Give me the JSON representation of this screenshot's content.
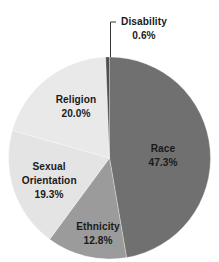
{
  "chart_data": {
    "type": "pie",
    "title": "",
    "start_angle_deg": 0,
    "direction": "clockwise",
    "slices": [
      {
        "label": "Race",
        "value": 47.3,
        "display": "47.3%",
        "color": "#707070"
      },
      {
        "label": "Ethnicity",
        "value": 12.8,
        "display": "12.8%",
        "color": "#9b9b9b"
      },
      {
        "label": "Sexual Orientation",
        "value": 19.3,
        "display": "19.3%",
        "color": "#e4e4e4"
      },
      {
        "label": "Religion",
        "value": 20.0,
        "display": "20.0%",
        "color": "#e9e9e9"
      },
      {
        "label": "Disability",
        "value": 0.6,
        "display": "0.6%",
        "color": "#505050"
      }
    ],
    "legend": "none",
    "annotations": [
      "Disability label connected with leader line"
    ]
  },
  "labels": {
    "race": {
      "name": "Race",
      "pct": "47.3%"
    },
    "ethnicity": {
      "name": "Ethnicity",
      "pct": "12.8%"
    },
    "sexual_orientation": {
      "line1": "Sexual",
      "line2": "Orientation",
      "pct": "19.3%"
    },
    "religion": {
      "name": "Religion",
      "pct": "20.0%"
    },
    "disability": {
      "name": "Disability",
      "pct": "0.6%"
    }
  }
}
